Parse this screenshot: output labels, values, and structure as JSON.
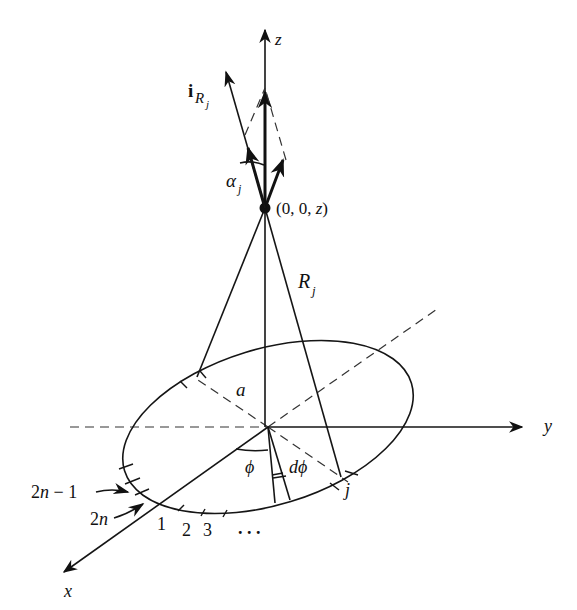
{
  "figure": {
    "type": "3D geometry diagram: ring of point sources on circle of radius a in the xy-plane, observation point on z axis",
    "axes": {
      "x": {
        "label": "x"
      },
      "y": {
        "label": "y"
      },
      "z": {
        "label": "z"
      }
    },
    "labels": {
      "unit_vector_main": "i",
      "unit_vector_sub": "R",
      "unit_vector_subsub": "j",
      "alpha_main": "α",
      "alpha_sub": "j",
      "point": "(0, 0, ",
      "point_z": "z",
      "point_close": ")",
      "distance_main": "R",
      "distance_sub": "j",
      "radius": "a",
      "angle_phi": "ϕ",
      "angle_dphi": "dϕ",
      "element_j": "j",
      "element_2n_minus_1": "2n − 1",
      "element_2n": "2n",
      "element_1": "1",
      "element_2": "2",
      "element_3": "3",
      "ellipsis": ". . ."
    },
    "colors": {
      "stroke": "#151515",
      "dashed": "#333333",
      "background": "#ffffff"
    }
  }
}
